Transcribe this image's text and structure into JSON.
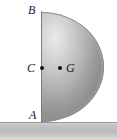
{
  "figure": {
    "labels": {
      "b": "B",
      "c": "C",
      "g": "G",
      "a": "A"
    },
    "points": {
      "c_name": "C",
      "g_name": "G",
      "a_name": "A",
      "b_name": "B"
    },
    "colors": {
      "body_light": "#e9e9e9",
      "body_mid": "#c8c8c8",
      "body_dark": "#8f8f8f",
      "outline": "#8c8c8c",
      "ground": "#b9b9b9",
      "ground_line": "#9a9a9a",
      "marker": "#111111",
      "text": "#1a1a1a",
      "background": "#ffffff"
    }
  }
}
